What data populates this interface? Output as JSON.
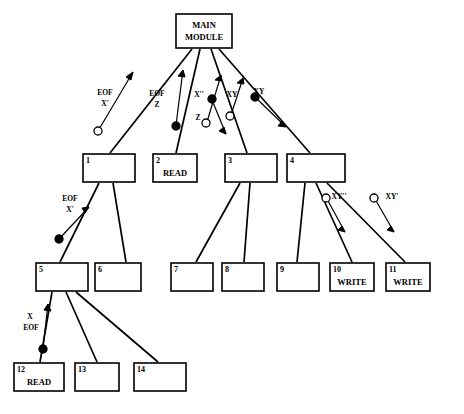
{
  "diagram": {
    "type": "structure-chart",
    "title": "",
    "modules": [
      {
        "id": "main",
        "number": "",
        "lines": [
          "MAIN",
          "MODULE"
        ],
        "x": 176,
        "y": 14,
        "w": 56,
        "h": 34
      },
      {
        "id": "m1",
        "number": "1",
        "lines": [],
        "x": 83,
        "y": 154,
        "w": 52,
        "h": 28
      },
      {
        "id": "m2",
        "number": "2",
        "lines": [
          "READ"
        ],
        "x": 153,
        "y": 154,
        "w": 44,
        "h": 28
      },
      {
        "id": "m3",
        "number": "3",
        "lines": [],
        "x": 225,
        "y": 154,
        "w": 52,
        "h": 28
      },
      {
        "id": "m4",
        "number": "4",
        "lines": [],
        "x": 287,
        "y": 154,
        "w": 58,
        "h": 28
      },
      {
        "id": "m5",
        "number": "5",
        "lines": [],
        "x": 36,
        "y": 263,
        "w": 52,
        "h": 28
      },
      {
        "id": "m6",
        "number": "6",
        "lines": [],
        "x": 95,
        "y": 263,
        "w": 46,
        "h": 28
      },
      {
        "id": "m7",
        "number": "7",
        "lines": [],
        "x": 171,
        "y": 263,
        "w": 42,
        "h": 28
      },
      {
        "id": "m8",
        "number": "8",
        "lines": [],
        "x": 222,
        "y": 263,
        "w": 42,
        "h": 28
      },
      {
        "id": "m9",
        "number": "9",
        "lines": [],
        "x": 277,
        "y": 263,
        "w": 42,
        "h": 28
      },
      {
        "id": "m10",
        "number": "10",
        "lines": [
          "WRITE"
        ],
        "x": 330,
        "y": 263,
        "w": 44,
        "h": 28
      },
      {
        "id": "m11",
        "number": "11",
        "lines": [
          "WRITE"
        ],
        "x": 386,
        "y": 263,
        "w": 44,
        "h": 28
      },
      {
        "id": "m12",
        "number": "12",
        "lines": [
          "READ"
        ],
        "x": 14,
        "y": 363,
        "w": 50,
        "h": 28
      },
      {
        "id": "m13",
        "number": "13",
        "lines": [],
        "x": 75,
        "y": 363,
        "w": 44,
        "h": 28
      },
      {
        "id": "m14",
        "number": "14",
        "lines": [],
        "x": 134,
        "y": 363,
        "w": 52,
        "h": 28
      }
    ],
    "couples": [
      {
        "id": "c1",
        "labels": [
          "EOF",
          "X'"
        ],
        "marker": "open-circle",
        "near": "main-to-1",
        "direction": "up"
      },
      {
        "id": "c2",
        "labels": [
          "EOF",
          "Z"
        ],
        "marker": "filled-circle",
        "near": "main-to-2",
        "direction": "up"
      },
      {
        "id": "c3",
        "labels": [
          "X''"
        ],
        "marker": "open-circle",
        "near": "main-to-3",
        "direction": "up"
      },
      {
        "id": "c4",
        "labels": [
          "Z"
        ],
        "marker": "filled-circle",
        "near": "main-to-3",
        "direction": "down"
      },
      {
        "id": "c5",
        "labels": [
          "XY"
        ],
        "marker": "open-circle",
        "near": "main-to-3b",
        "direction": "up"
      },
      {
        "id": "c6",
        "labels": [
          "XY"
        ],
        "marker": "filled-circle",
        "near": "main-to-4",
        "direction": "down"
      },
      {
        "id": "c7",
        "labels": [
          "EOF",
          "X'"
        ],
        "marker": "filled-circle",
        "near": "1-to-5",
        "direction": "up"
      },
      {
        "id": "c8",
        "labels": [
          "XY''"
        ],
        "marker": "open-circle",
        "near": "4-to-10",
        "direction": "down"
      },
      {
        "id": "c9",
        "labels": [
          "XY'"
        ],
        "marker": "open-circle",
        "near": "4-to-11",
        "direction": "down"
      },
      {
        "id": "c10",
        "labels": [
          "X",
          "EOF"
        ],
        "marker": "filled-circle",
        "near": "5-to-12",
        "direction": "up"
      }
    ],
    "colors": {
      "stroke": "#000000",
      "fill": "#ffffff",
      "text": "#000000"
    }
  }
}
